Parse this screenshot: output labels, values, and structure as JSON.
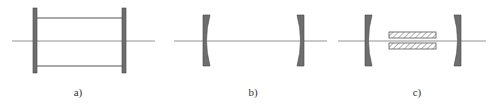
{
  "colors": {
    "stroke": "#555555",
    "fill": "#6e6e6e",
    "axis": "#777777",
    "hatch": "#666666",
    "background": "#ffffff"
  },
  "panels": [
    {
      "id": "a",
      "label": "a)",
      "label_x": 78,
      "description": "two flat plates joined by rails"
    },
    {
      "id": "b",
      "label": "b)",
      "label_x": 253,
      "description": "two concave mirrors"
    },
    {
      "id": "c",
      "label": "c)",
      "label_x": 417,
      "description": "two concave mirrors with hatched active elements"
    }
  ],
  "label_y": 88
}
